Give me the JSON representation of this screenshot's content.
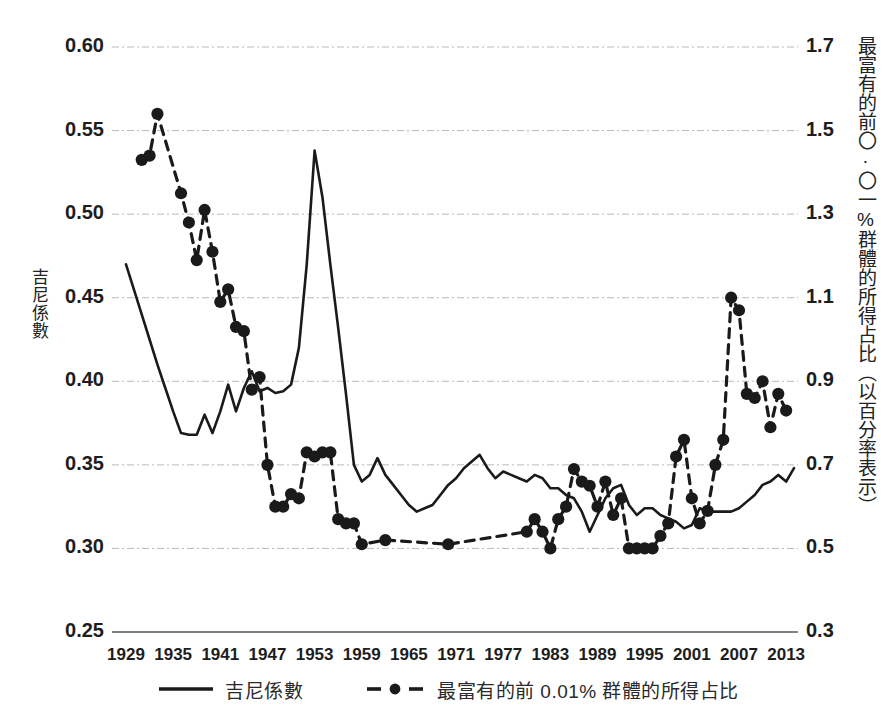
{
  "axes": {
    "left_label": "吉尼係數",
    "right_label": "最富有的前〇·〇一%群體的所得占比（以百分率表示）",
    "left_ticks": [
      "0.60",
      "0.55",
      "0.50",
      "0.45",
      "0.40",
      "0.35",
      "0.30",
      "0.25"
    ],
    "right_ticks": [
      "1.7",
      "1.5",
      "1.3",
      "1.1",
      "0.9",
      "0.7",
      "0.5",
      "0.3"
    ],
    "x_ticks": [
      "1929",
      "1935",
      "1941",
      "1947",
      "1953",
      "1959",
      "1965",
      "1971",
      "1977",
      "1983",
      "1989",
      "1995",
      "2001",
      "2007",
      "2013"
    ]
  },
  "legend": {
    "items": [
      {
        "label": "吉尼係數",
        "style": "solid"
      },
      {
        "label": "最富有的前 0.01% 群體的所得占比",
        "style": "dashed-marker"
      }
    ]
  },
  "colors": {
    "ink": "#1a1a1a",
    "grid": "#b9b9c4",
    "axis": "#555560"
  },
  "chart_data": {
    "type": "line",
    "title": "",
    "xlabel": "",
    "ylabel": "吉尼係數",
    "y2label": "最富有的前〇·〇一%群體的所得占比（以百分率表示）",
    "grid": true,
    "legend_position": "bottom",
    "xlim": [
      1929,
      2014
    ],
    "ylim": [
      0.25,
      0.6
    ],
    "y2lim": [
      0.3,
      1.7
    ],
    "xtick_step": 6,
    "series": [
      {
        "name": "吉尼係數",
        "axis": "left",
        "style": "solid",
        "marker": "none",
        "x": [
          1929,
          1930,
          1931,
          1932,
          1933,
          1934,
          1935,
          1936,
          1937,
          1938,
          1939,
          1940,
          1941,
          1942,
          1943,
          1944,
          1945,
          1946,
          1947,
          1948,
          1949,
          1950,
          1951,
          1952,
          1953,
          1954,
          1955,
          1956,
          1957,
          1958,
          1959,
          1960,
          1961,
          1962,
          1963,
          1964,
          1965,
          1966,
          1967,
          1968,
          1969,
          1970,
          1971,
          1972,
          1973,
          1974,
          1975,
          1976,
          1977,
          1978,
          1979,
          1980,
          1981,
          1982,
          1983,
          1984,
          1985,
          1986,
          1987,
          1988,
          1989,
          1990,
          1991,
          1992,
          1993,
          1994,
          1995,
          1996,
          1997,
          1998,
          1999,
          2000,
          2001,
          2002,
          2003,
          2004,
          2005,
          2006,
          2007,
          2008,
          2009,
          2010,
          2011,
          2012,
          2013,
          2014
        ],
        "values": [
          0.47,
          0.455,
          0.44,
          0.425,
          0.41,
          0.396,
          0.382,
          0.369,
          0.368,
          0.368,
          0.38,
          0.369,
          0.382,
          0.398,
          0.382,
          0.396,
          0.406,
          0.394,
          0.396,
          0.393,
          0.394,
          0.398,
          0.42,
          0.47,
          0.538,
          0.51,
          0.47,
          0.432,
          0.392,
          0.35,
          0.34,
          0.344,
          0.354,
          0.344,
          0.338,
          0.332,
          0.326,
          0.322,
          0.324,
          0.326,
          0.332,
          0.338,
          0.342,
          0.348,
          0.352,
          0.356,
          0.348,
          0.342,
          0.346,
          0.344,
          0.342,
          0.34,
          0.344,
          0.342,
          0.336,
          0.336,
          0.332,
          0.33,
          0.322,
          0.31,
          0.32,
          0.33,
          0.336,
          0.338,
          0.326,
          0.32,
          0.324,
          0.324,
          0.32,
          0.318,
          0.316,
          0.312,
          0.314,
          0.324,
          0.322,
          0.322,
          0.322,
          0.322,
          0.324,
          0.328,
          0.332,
          0.338,
          0.34,
          0.344,
          0.34,
          0.348
        ]
      },
      {
        "name": "最富有的前 0.01% 群體的所得占比",
        "axis": "right",
        "style": "dashed",
        "marker": "circle",
        "x": [
          1931,
          1932,
          1933,
          1936,
          1937,
          1938,
          1939,
          1940,
          1941,
          1942,
          1943,
          1944,
          1945,
          1946,
          1947,
          1948,
          1949,
          1950,
          1951,
          1952,
          1953,
          1954,
          1955,
          1956,
          1957,
          1958,
          1959,
          1962,
          1970,
          1980,
          1981,
          1982,
          1983,
          1984,
          1985,
          1986,
          1987,
          1988,
          1989,
          1990,
          1991,
          1992,
          1993,
          1994,
          1995,
          1996,
          1997,
          1998,
          1999,
          2000,
          2001,
          2002,
          2003,
          2004,
          2005,
          2006,
          2007,
          2008,
          2009,
          2010,
          2011,
          2012,
          2013
        ],
        "values": [
          1.43,
          1.44,
          1.54,
          1.35,
          1.28,
          1.19,
          1.31,
          1.21,
          1.09,
          1.12,
          1.03,
          1.02,
          0.88,
          0.91,
          0.7,
          0.6,
          0.6,
          0.63,
          0.62,
          0.73,
          0.72,
          0.73,
          0.73,
          0.57,
          0.56,
          0.56,
          0.51,
          0.52,
          0.51,
          0.54,
          0.57,
          0.54,
          0.5,
          0.57,
          0.6,
          0.69,
          0.66,
          0.65,
          0.6,
          0.66,
          0.58,
          0.62,
          0.5,
          0.5,
          0.5,
          0.5,
          0.53,
          0.56,
          0.72,
          0.76,
          0.62,
          0.56,
          0.59,
          0.7,
          0.76,
          1.1,
          1.07,
          0.87,
          0.86,
          0.9,
          0.79,
          0.87,
          0.83
        ]
      }
    ]
  }
}
